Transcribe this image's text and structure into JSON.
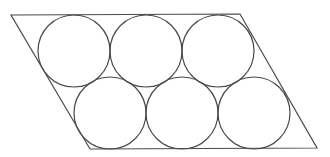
{
  "diagram": {
    "stroke_color": "#4a4a4a",
    "background": "#ffffff",
    "parallelogram": {
      "points": [
        [
          11,
          15
        ],
        [
          240,
          14
        ],
        [
          317,
          148
        ],
        [
          90,
          149
        ]
      ]
    },
    "circles": [
      {
        "id": "top-1",
        "cx": 74,
        "cy": 51,
        "r": 36
      },
      {
        "id": "top-2",
        "cx": 146,
        "cy": 51,
        "r": 36
      },
      {
        "id": "top-3",
        "cx": 218,
        "cy": 51,
        "r": 36
      },
      {
        "id": "bottom-1",
        "cx": 110,
        "cy": 113,
        "r": 36
      },
      {
        "id": "bottom-2",
        "cx": 182,
        "cy": 113,
        "r": 36
      },
      {
        "id": "bottom-3",
        "cx": 254,
        "cy": 113,
        "r": 36
      }
    ],
    "rows": 2,
    "circles_per_row": 3
  }
}
